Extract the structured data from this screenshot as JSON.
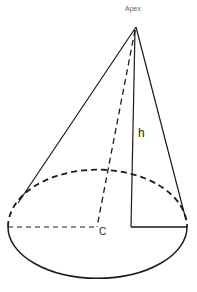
{
  "diagram": {
    "type": "right-circular-cone",
    "labels": {
      "apex": "Apex",
      "height": "h",
      "center": "C"
    },
    "colors": {
      "stroke": "#1a1a1a",
      "background": "#ffffff",
      "apex_label": "#666666"
    }
  }
}
